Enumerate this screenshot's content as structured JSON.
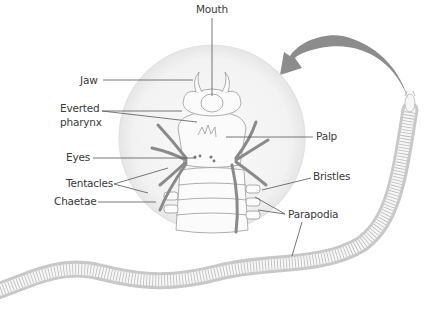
{
  "diagram": {
    "labels": {
      "mouth": "Mouth",
      "jaw": "Jaw",
      "everted_pharynx_1": "Everted",
      "everted_pharynx_2": "pharynx",
      "eyes": "Eyes",
      "tentacles": "Tentacles",
      "chaetae": "Chaetae",
      "palp": "Palp",
      "bristles": "Bristles",
      "parapodia": "Parapodia"
    },
    "colors": {
      "line": "#555555",
      "outline": "#9a9a9a",
      "tentacle": "#8a8a8a",
      "magnifier": "#f4f4f4",
      "arrow": "#8c8c8c",
      "text": "#3a3a3a"
    }
  }
}
